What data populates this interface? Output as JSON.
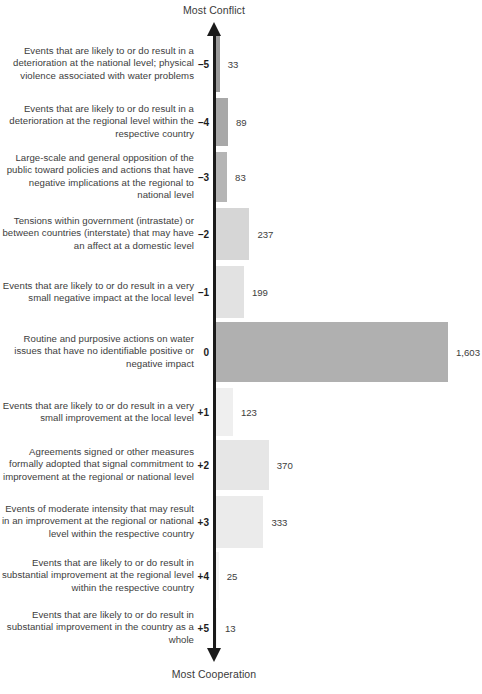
{
  "axis": {
    "top_label": "Most Conflict",
    "bottom_label": "Most Cooperation",
    "top_arrow_icon": "arrow-up-icon",
    "bottom_arrow_icon": "arrow-down-icon",
    "line_color": "#1a1a1a"
  },
  "chart_data": {
    "type": "bar",
    "orientation": "horizontal",
    "title": "",
    "subtitle": "",
    "xlabel": "",
    "ylabel": "",
    "grid": false,
    "legend": null,
    "xlim": [
      0,
      1603
    ],
    "axis_annotations": {
      "top": "Most Conflict",
      "bottom": "Most Cooperation"
    },
    "categories": [
      "–5",
      "–4",
      "–3",
      "–2",
      "–1",
      "0",
      "+1",
      "+2",
      "+3",
      "+4",
      "+5"
    ],
    "values": [
      33,
      89,
      83,
      237,
      199,
      1603,
      123,
      370,
      333,
      25,
      13
    ],
    "value_labels": [
      "33",
      "89",
      "83",
      "237",
      "199",
      "1,603",
      "123",
      "370",
      "333",
      "25",
      "13"
    ],
    "category_descriptions": [
      "Events that are likely to or do result in a deterioration at the national level; physical violence associated with water problems",
      "Events that are likely to or do result in a deterioration at the regional level within the respective country",
      "Large-scale and general opposition of the public toward policies and actions that have negative implications at the regional to national level",
      "Tensions within government (intrastate) or between countries (interstate) that may have an affect at a domestic level",
      "Events that are likely to or do result in a very small negative impact at the local level",
      "Routine and purposive actions on water issues that have no identifiable positive or negative impact",
      "Events that are likely to or do result in a very small improvement at the local level",
      "Agreements signed or other measures formally adopted that signal commitment to improvement at the regional or national level",
      "Events of moderate intensity that may result in an improvement at the regional or national level within the respective country",
      "Events that are likely to or do result in substantial improvement at the regional level within the respective country",
      "Events that are likely to or do result in substantial improvement in the country as a whole"
    ],
    "bar_colors": [
      "#9a9a9a",
      "#a8a8a8",
      "#b5b5b5",
      "#d6d6d6",
      "#e2e2e2",
      "#b0b0b0",
      "#efefef",
      "#e6e6e6",
      "#ebebeb",
      "#f3f3f3",
      "#f6f6f6"
    ]
  },
  "rows": [
    {
      "tick": "–5",
      "value_label": "33",
      "desc": "Events that are likely to or do result in a deterioration at the national level; physical violence associated with water problems"
    },
    {
      "tick": "–4",
      "value_label": "89",
      "desc": "Events that are likely to or do result in a deterioration at the regional level within the respective country"
    },
    {
      "tick": "–3",
      "value_label": "83",
      "desc": "Large-scale and general opposition of the public toward policies and actions that have negative implications at the regional to national level"
    },
    {
      "tick": "–2",
      "value_label": "237",
      "desc": "Tensions within government (intrastate) or between countries (interstate) that may have an affect at a domestic level"
    },
    {
      "tick": "–1",
      "value_label": "199",
      "desc": "Events that are likely to or do result in a very small negative impact at the local level"
    },
    {
      "tick": "0",
      "value_label": "1,603",
      "desc": "Routine and purposive actions on water issues that have no identifiable positive or negative impact"
    },
    {
      "tick": "+1",
      "value_label": "123",
      "desc": "Events that are likely to or do result in a very small improvement at the local level"
    },
    {
      "tick": "+2",
      "value_label": "370",
      "desc": "Agreements signed or other measures formally adopted that signal commitment to improvement at the regional or national level"
    },
    {
      "tick": "+3",
      "value_label": "333",
      "desc": "Events of moderate intensity that may result in an improvement at the regional or national level within the respective country"
    },
    {
      "tick": "+4",
      "value_label": "25",
      "desc": "Events that are likely to or do result in substantial improvement at the regional level within the respective country"
    },
    {
      "tick": "+5",
      "value_label": "13",
      "desc": "Events that are likely to or do result in substantial improvement in the country as a whole"
    }
  ],
  "layout": {
    "row_tops": [
      36,
      98,
      152,
      208,
      266,
      322,
      388,
      440,
      496,
      552,
      608
    ],
    "row_heights": [
      56,
      48,
      50,
      52,
      52,
      60,
      48,
      50,
      52,
      48,
      40
    ],
    "label_tops": [
      45,
      110,
      160,
      220,
      278,
      337,
      396,
      450,
      505,
      560,
      613
    ]
  }
}
